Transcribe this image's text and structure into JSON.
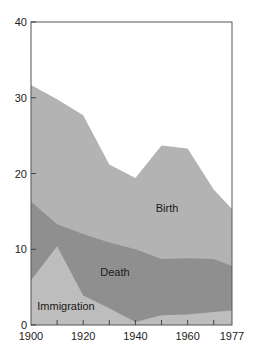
{
  "chart_data": {
    "type": "area",
    "title": "",
    "xlabel": "",
    "ylabel": "",
    "xlim": [
      1900,
      1977
    ],
    "ylim": [
      0,
      40
    ],
    "grid": false,
    "legend": "inline labels",
    "x": [
      1900,
      1910,
      1920,
      1930,
      1940,
      1950,
      1960,
      1970,
      1977
    ],
    "x_tick_labels": [
      "1900",
      "1920",
      "1940",
      "1960",
      "1977"
    ],
    "y_tick_labels": [
      "0",
      "10",
      "20",
      "30",
      "40"
    ],
    "series": [
      {
        "name": "Birth",
        "label": "Birth",
        "color": "#b3b3b3",
        "values_top": [
          31.7,
          29.8,
          27.7,
          21.2,
          19.4,
          23.7,
          23.3,
          17.9,
          15.3
        ]
      },
      {
        "name": "Death",
        "label": "Death",
        "color": "#8f8f8f",
        "values_top": [
          16.3,
          13.3,
          12.0,
          10.9,
          10.0,
          8.7,
          8.8,
          8.7,
          7.8
        ]
      },
      {
        "name": "Immigration",
        "label": "Immigration",
        "color": "#bdbdbd",
        "values_top": [
          5.9,
          10.4,
          3.9,
          2.2,
          0.4,
          1.3,
          1.4,
          1.7,
          1.9
        ]
      }
    ]
  }
}
